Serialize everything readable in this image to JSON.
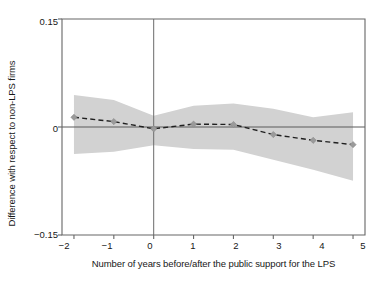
{
  "chart_data": {
    "type": "line",
    "title": "",
    "subtitle": "",
    "xlabel": "Number of years before/after the public support for the LPS",
    "ylabel": "Difference with respect to non-LPS firms",
    "xlim": [
      -2.3,
      5.3
    ],
    "ylim": [
      -0.15,
      0.15
    ],
    "xticks": [
      -2,
      -1,
      0,
      1,
      2,
      3,
      4,
      5
    ],
    "xtick_labels": [
      "−2",
      "−1",
      "0",
      "1",
      "2",
      "3",
      "4",
      "5"
    ],
    "yticks": [
      -0.15,
      0,
      0.15
    ],
    "ytick_labels": [
      "−0.15",
      "0",
      "0.15"
    ],
    "grid": false,
    "legend": null,
    "zero_line": 0,
    "event_line_x": 0,
    "x": [
      -2,
      -1,
      0,
      1,
      2,
      3,
      4,
      5
    ],
    "series": [
      {
        "name": "Point estimate",
        "style": "dashed",
        "marker": "diamond",
        "values": [
          0.0135,
          0.0075,
          -0.0025,
          0.004,
          0.0035,
          -0.0105,
          -0.0185,
          -0.0245
        ]
      },
      {
        "name": "Confidence interval upper",
        "style": "band",
        "values": [
          0.0445,
          0.0375,
          0.0155,
          0.0295,
          0.0325,
          0.0255,
          0.0135,
          0.0205
        ]
      },
      {
        "name": "Confidence interval lower",
        "style": "band",
        "values": [
          -0.0375,
          -0.0345,
          -0.0255,
          -0.0305,
          -0.0315,
          -0.0455,
          -0.0595,
          -0.0745
        ]
      }
    ],
    "band_fill_color": "#d2d2d2",
    "line_color": "#202020",
    "marker_color": "#9a9a9a",
    "axis_color": "#555555",
    "background_color": "#ffffff"
  },
  "axes": {
    "x_label": "Number of years before/after the public support for the LPS",
    "y_label": "Difference with respect to non-LPS firms",
    "y_tick_top": "0.15",
    "y_tick_mid": "0",
    "y_tick_bottom": "−0.15",
    "x_tick_0": "−2",
    "x_tick_1": "−1",
    "x_tick_2": "0",
    "x_tick_3": "1",
    "x_tick_4": "2",
    "x_tick_5": "3",
    "x_tick_6": "4",
    "x_tick_7": "5"
  }
}
